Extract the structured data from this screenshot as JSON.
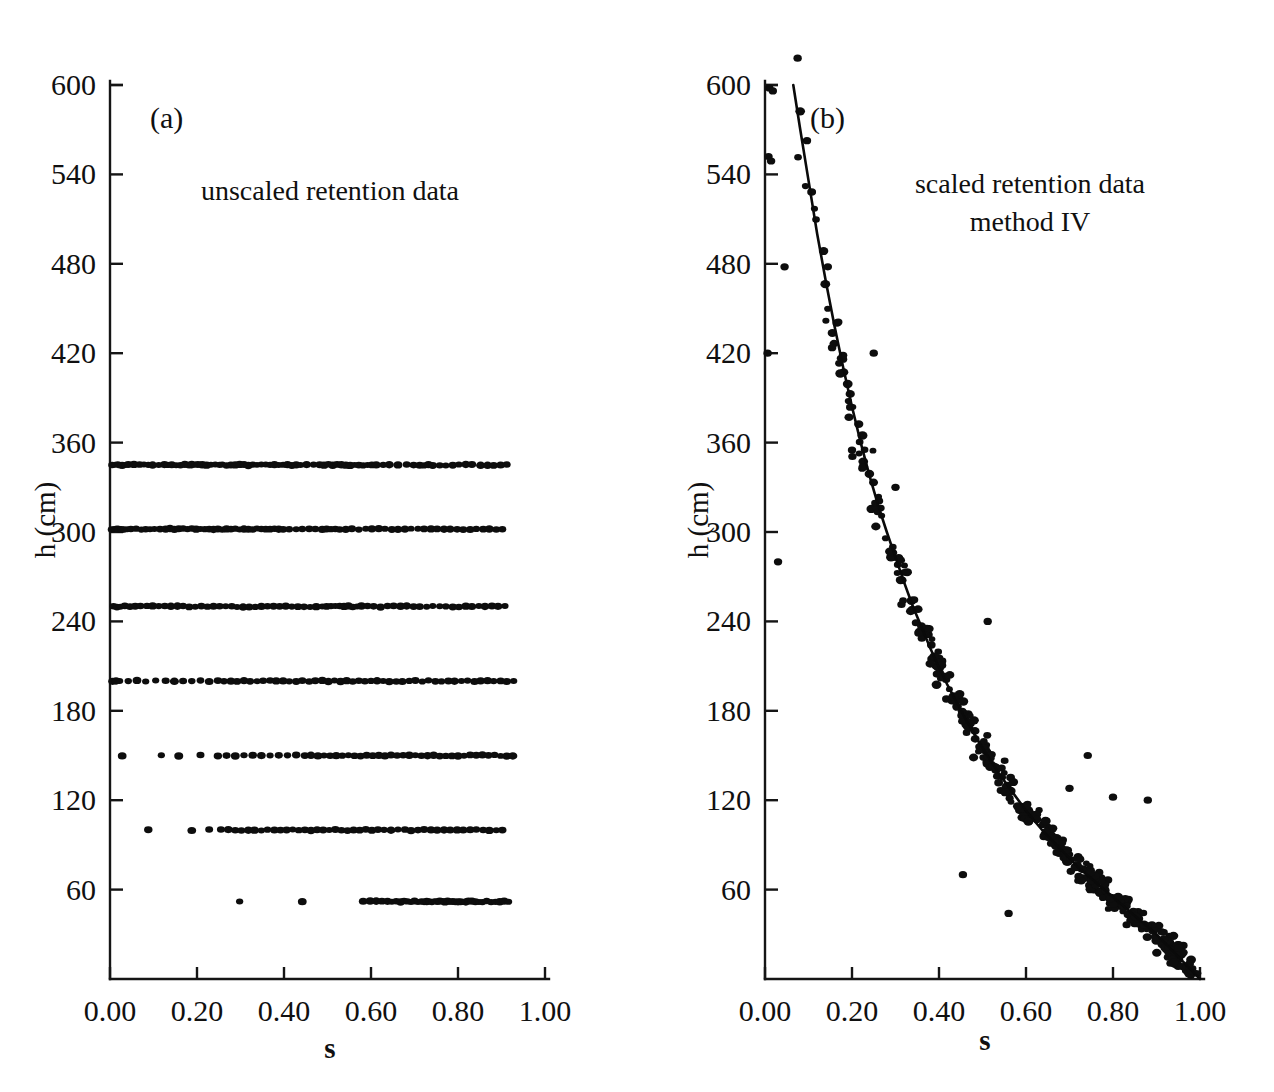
{
  "figure": {
    "title": "",
    "panels": [
      {
        "id": "a",
        "letter": "(a)",
        "annotation_lines": [
          "unscaled retention data"
        ],
        "xlabel": "s",
        "ylabel": "h (cm)"
      },
      {
        "id": "b",
        "letter": "(b)",
        "annotation_lines": [
          "scaled retention data",
          "method IV"
        ],
        "xlabel": "s",
        "ylabel": "h (cm)"
      }
    ]
  },
  "axes": {
    "x_ticks": [
      0.0,
      0.2,
      0.4,
      0.6,
      0.8,
      1.0
    ],
    "x_tick_labels": [
      "0.00",
      "0.20",
      "0.40",
      "0.60",
      "0.80",
      "1.00"
    ],
    "y_ticks": [
      60,
      120,
      180,
      240,
      300,
      360,
      420,
      480,
      540,
      600
    ],
    "y_tick_labels": [
      "60",
      "120",
      "180",
      "240",
      "300",
      "360",
      "420",
      "480",
      "540",
      "600"
    ],
    "xlim": [
      0.0,
      1.0
    ],
    "ylim": [
      0,
      620
    ],
    "grid": false
  },
  "chart_data": [
    {
      "type": "scatter",
      "panel": "a",
      "title": "unscaled retention data",
      "xlabel": "s",
      "ylabel": "h (cm)",
      "xlim": [
        0.0,
        1.0
      ],
      "ylim": [
        0,
        620
      ],
      "grid": false,
      "legend": "none",
      "marker": "filled-circle",
      "description": "Water retention measurements at seven discrete pressure-head levels; saturation s spread horizontally at each level.",
      "series": [
        {
          "name": "h = 345 cm",
          "h": 345,
          "s": [
            0.005,
            0.012,
            0.018,
            0.022,
            0.028,
            0.035,
            0.042,
            0.055,
            0.068,
            0.078,
            0.088,
            0.098,
            0.112,
            0.125,
            0.132,
            0.142,
            0.152,
            0.162,
            0.172,
            0.182,
            0.188,
            0.195,
            0.202,
            0.212,
            0.222,
            0.232,
            0.242,
            0.252,
            0.258,
            0.268,
            0.278,
            0.288,
            0.298,
            0.308,
            0.318,
            0.328,
            0.338,
            0.348,
            0.358,
            0.368,
            0.378,
            0.388,
            0.398,
            0.408,
            0.418,
            0.428,
            0.438,
            0.452,
            0.468,
            0.482,
            0.492,
            0.502,
            0.512,
            0.522,
            0.532,
            0.542,
            0.552,
            0.562,
            0.572,
            0.582,
            0.592,
            0.602,
            0.612,
            0.628,
            0.642,
            0.662,
            0.682,
            0.698,
            0.712,
            0.722,
            0.732,
            0.742,
            0.758,
            0.772,
            0.788,
            0.802,
            0.818,
            0.832,
            0.852,
            0.868,
            0.882,
            0.898,
            0.912
          ]
        },
        {
          "name": "h = 302 cm",
          "h": 302,
          "s": [
            0.004,
            0.01,
            0.016,
            0.02,
            0.026,
            0.032,
            0.04,
            0.048,
            0.06,
            0.072,
            0.082,
            0.092,
            0.102,
            0.115,
            0.128,
            0.138,
            0.148,
            0.158,
            0.168,
            0.178,
            0.188,
            0.198,
            0.208,
            0.218,
            0.228,
            0.238,
            0.248,
            0.258,
            0.268,
            0.278,
            0.288,
            0.298,
            0.308,
            0.318,
            0.328,
            0.338,
            0.348,
            0.358,
            0.368,
            0.378,
            0.388,
            0.398,
            0.412,
            0.428,
            0.442,
            0.458,
            0.472,
            0.488,
            0.498,
            0.508,
            0.518,
            0.528,
            0.542,
            0.556,
            0.572,
            0.588,
            0.602,
            0.618,
            0.632,
            0.648,
            0.662,
            0.678,
            0.692,
            0.708,
            0.722,
            0.738,
            0.752,
            0.768,
            0.782,
            0.798,
            0.812,
            0.828,
            0.842,
            0.858,
            0.872,
            0.888,
            0.902
          ]
        },
        {
          "name": "h = 250 cm",
          "h": 250,
          "s": [
            0.008,
            0.016,
            0.024,
            0.034,
            0.046,
            0.058,
            0.07,
            0.085,
            0.098,
            0.112,
            0.126,
            0.14,
            0.155,
            0.168,
            0.182,
            0.196,
            0.21,
            0.224,
            0.238,
            0.252,
            0.266,
            0.28,
            0.292,
            0.306,
            0.32,
            0.334,
            0.348,
            0.362,
            0.376,
            0.39,
            0.404,
            0.418,
            0.432,
            0.446,
            0.46,
            0.474,
            0.488,
            0.498,
            0.508,
            0.518,
            0.528,
            0.538,
            0.548,
            0.558,
            0.568,
            0.578,
            0.592,
            0.606,
            0.622,
            0.638,
            0.652,
            0.668,
            0.682,
            0.698,
            0.712,
            0.728,
            0.742,
            0.758,
            0.772,
            0.788,
            0.802,
            0.818,
            0.832,
            0.848,
            0.862,
            0.878,
            0.892,
            0.908
          ]
        },
        {
          "name": "h = 200 cm",
          "h": 200,
          "s": [
            0.006,
            0.014,
            0.022,
            0.042,
            0.062,
            0.082,
            0.105,
            0.128,
            0.148,
            0.168,
            0.188,
            0.208,
            0.228,
            0.248,
            0.262,
            0.278,
            0.292,
            0.308,
            0.322,
            0.338,
            0.352,
            0.368,
            0.382,
            0.398,
            0.412,
            0.428,
            0.442,
            0.458,
            0.472,
            0.488,
            0.502,
            0.516,
            0.53,
            0.544,
            0.558,
            0.572,
            0.586,
            0.6,
            0.614,
            0.628,
            0.642,
            0.658,
            0.672,
            0.688,
            0.702,
            0.718,
            0.732,
            0.748,
            0.762,
            0.778,
            0.792,
            0.808,
            0.822,
            0.838,
            0.852,
            0.868,
            0.882,
            0.898,
            0.912,
            0.928
          ]
        },
        {
          "name": "h = 150 cm",
          "h": 150,
          "s": [
            0.028,
            0.118,
            0.158,
            0.208,
            0.248,
            0.268,
            0.288,
            0.308,
            0.328,
            0.348,
            0.368,
            0.388,
            0.408,
            0.428,
            0.448,
            0.462,
            0.478,
            0.492,
            0.506,
            0.52,
            0.534,
            0.548,
            0.562,
            0.576,
            0.59,
            0.604,
            0.618,
            0.632,
            0.646,
            0.66,
            0.674,
            0.688,
            0.702,
            0.716,
            0.73,
            0.744,
            0.758,
            0.772,
            0.786,
            0.8,
            0.814,
            0.828,
            0.842,
            0.856,
            0.87,
            0.884,
            0.898,
            0.912,
            0.926
          ]
        },
        {
          "name": "h = 100 cm",
          "h": 100,
          "s": [
            0.088,
            0.188,
            0.228,
            0.255,
            0.272,
            0.288,
            0.302,
            0.318,
            0.332,
            0.348,
            0.362,
            0.378,
            0.392,
            0.406,
            0.42,
            0.434,
            0.448,
            0.462,
            0.476,
            0.49,
            0.504,
            0.518,
            0.532,
            0.546,
            0.56,
            0.574,
            0.588,
            0.602,
            0.616,
            0.63,
            0.646,
            0.662,
            0.678,
            0.692,
            0.708,
            0.722,
            0.738,
            0.752,
            0.768,
            0.782,
            0.798,
            0.812,
            0.828,
            0.842,
            0.858,
            0.872,
            0.888,
            0.902
          ]
        },
        {
          "name": "h = 52 cm",
          "h": 52,
          "s": [
            0.298,
            0.442,
            0.582,
            0.598,
            0.612,
            0.625,
            0.638,
            0.648,
            0.658,
            0.668,
            0.676,
            0.684,
            0.692,
            0.7,
            0.708,
            0.716,
            0.722,
            0.728,
            0.734,
            0.74,
            0.746,
            0.752,
            0.758,
            0.764,
            0.77,
            0.776,
            0.782,
            0.788,
            0.794,
            0.8,
            0.806,
            0.812,
            0.818,
            0.824,
            0.832,
            0.84,
            0.848,
            0.856,
            0.866,
            0.876,
            0.886,
            0.896,
            0.906,
            0.916
          ]
        }
      ]
    },
    {
      "type": "scatter",
      "panel": "b",
      "title": "scaled retention data method IV",
      "xlabel": "s",
      "ylabel": "h (cm)",
      "xlim": [
        0.0,
        1.0
      ],
      "ylim": [
        0,
        620
      ],
      "grid": false,
      "legend": "none",
      "marker": "filled-circle",
      "description": "Scaled retention data collapsing onto a single monotonically decreasing reference curve fitted by method IV; curve runs from about (0.065, 600) down to (1.00, 0).",
      "fit_curve": {
        "name": "method IV reference curve",
        "s": [
          0.065,
          0.08,
          0.1,
          0.12,
          0.14,
          0.16,
          0.18,
          0.2,
          0.22,
          0.24,
          0.26,
          0.28,
          0.3,
          0.32,
          0.34,
          0.36,
          0.38,
          0.4,
          0.42,
          0.44,
          0.46,
          0.48,
          0.5,
          0.52,
          0.54,
          0.56,
          0.58,
          0.6,
          0.62,
          0.64,
          0.66,
          0.68,
          0.7,
          0.72,
          0.74,
          0.76,
          0.78,
          0.8,
          0.82,
          0.84,
          0.86,
          0.88,
          0.9,
          0.92,
          0.94,
          0.96,
          0.98,
          1.0
        ],
        "h": [
          600,
          572,
          536,
          500,
          468,
          438,
          410,
          384,
          360,
          338,
          318,
          300,
          283,
          266,
          250,
          236,
          222,
          209,
          197,
          186,
          175,
          165,
          155,
          146,
          137,
          129,
          121,
          113,
          106,
          99,
          93,
          87,
          81,
          75,
          70,
          65,
          60,
          55,
          50,
          45,
          40,
          35,
          30,
          24,
          18,
          12,
          6,
          0
        ]
      },
      "scatter_note": "approximately 380 measurement points scattered about the fitted curve, with a few outliers above the curve near s=0.50-0.90 at h=240, 150 and 120 cm"
    }
  ],
  "colors": {
    "ink": "#101010",
    "background": "#ffffff",
    "marker": "#0d0d0d",
    "curve": "#0a0a0a"
  }
}
